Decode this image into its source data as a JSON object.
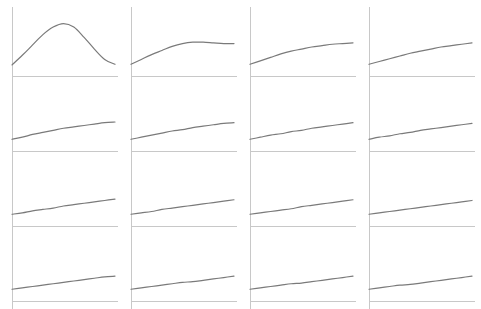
{
  "figure": {
    "rows": 4,
    "cols": 4,
    "axis_color": "#c8c8c8",
    "line_color": "#7a7a7a",
    "background": "#ffffff"
  },
  "layout": {
    "col_axis_x": [
      12,
      131,
      250,
      369
    ],
    "row_axis_y": [
      76,
      151,
      226,
      301
    ],
    "plot_width": 106,
    "plot_height": 69,
    "curve_width": 103,
    "tick_length": 8
  },
  "chart_data": [
    {
      "type": "line",
      "panel": 1,
      "title": "",
      "xlabel": "",
      "ylabel": "",
      "grid": false,
      "ylim": [
        0,
        1
      ],
      "x": [
        0,
        0.1,
        0.2,
        0.3,
        0.4,
        0.5,
        0.6,
        0.7,
        0.8,
        0.9,
        1.0
      ],
      "y": [
        0.16,
        0.3,
        0.45,
        0.6,
        0.71,
        0.76,
        0.71,
        0.56,
        0.39,
        0.24,
        0.17
      ]
    },
    {
      "type": "line",
      "panel": 2,
      "title": "",
      "xlabel": "",
      "ylabel": "",
      "grid": false,
      "ylim": [
        0,
        1
      ],
      "x": [
        0,
        0.1,
        0.2,
        0.3,
        0.4,
        0.5,
        0.6,
        0.7,
        0.8,
        0.9,
        1.0
      ],
      "y": [
        0.17,
        0.24,
        0.31,
        0.37,
        0.43,
        0.47,
        0.49,
        0.49,
        0.48,
        0.47,
        0.47
      ]
    },
    {
      "type": "line",
      "panel": 3,
      "title": "",
      "xlabel": "",
      "ylabel": "",
      "grid": false,
      "ylim": [
        0,
        1
      ],
      "x": [
        0,
        0.1,
        0.2,
        0.3,
        0.4,
        0.5,
        0.6,
        0.7,
        0.8,
        0.9,
        1.0
      ],
      "y": [
        0.17,
        0.22,
        0.27,
        0.32,
        0.36,
        0.39,
        0.42,
        0.44,
        0.46,
        0.47,
        0.48
      ]
    },
    {
      "type": "line",
      "panel": 4,
      "title": "",
      "xlabel": "",
      "ylabel": "",
      "grid": false,
      "ylim": [
        0,
        1
      ],
      "x": [
        0,
        0.1,
        0.2,
        0.3,
        0.4,
        0.5,
        0.6,
        0.7,
        0.8,
        0.9,
        1.0
      ],
      "y": [
        0.17,
        0.21,
        0.25,
        0.29,
        0.33,
        0.36,
        0.39,
        0.42,
        0.44,
        0.46,
        0.48
      ]
    },
    {
      "type": "line",
      "panel": 5,
      "title": "",
      "xlabel": "",
      "ylabel": "",
      "grid": false,
      "ylim": [
        0,
        1
      ],
      "x": [
        0,
        0.1,
        0.2,
        0.3,
        0.4,
        0.5,
        0.6,
        0.7,
        0.8,
        0.9,
        1.0
      ],
      "y": [
        0.17,
        0.2,
        0.24,
        0.27,
        0.3,
        0.33,
        0.35,
        0.37,
        0.39,
        0.41,
        0.42
      ]
    },
    {
      "type": "line",
      "panel": 6,
      "title": "",
      "xlabel": "",
      "ylabel": "",
      "grid": false,
      "ylim": [
        0,
        1
      ],
      "x": [
        0,
        0.1,
        0.2,
        0.3,
        0.4,
        0.5,
        0.6,
        0.7,
        0.8,
        0.9,
        1.0
      ],
      "y": [
        0.17,
        0.2,
        0.23,
        0.26,
        0.29,
        0.31,
        0.34,
        0.36,
        0.38,
        0.4,
        0.41
      ]
    },
    {
      "type": "line",
      "panel": 7,
      "title": "",
      "xlabel": "",
      "ylabel": "",
      "grid": false,
      "ylim": [
        0,
        1
      ],
      "x": [
        0,
        0.1,
        0.2,
        0.3,
        0.4,
        0.5,
        0.6,
        0.7,
        0.8,
        0.9,
        1.0
      ],
      "y": [
        0.17,
        0.2,
        0.23,
        0.25,
        0.28,
        0.3,
        0.33,
        0.35,
        0.37,
        0.39,
        0.41
      ]
    },
    {
      "type": "line",
      "panel": 8,
      "title": "",
      "xlabel": "",
      "ylabel": "",
      "grid": false,
      "ylim": [
        0,
        1
      ],
      "x": [
        0,
        0.1,
        0.2,
        0.3,
        0.4,
        0.5,
        0.6,
        0.7,
        0.8,
        0.9,
        1.0
      ],
      "y": [
        0.17,
        0.2,
        0.22,
        0.25,
        0.27,
        0.3,
        0.32,
        0.34,
        0.36,
        0.38,
        0.4
      ]
    },
    {
      "type": "line",
      "panel": 9,
      "title": "",
      "xlabel": "",
      "ylabel": "",
      "grid": false,
      "ylim": [
        0,
        1
      ],
      "x": [
        0,
        0.1,
        0.2,
        0.3,
        0.4,
        0.5,
        0.6,
        0.7,
        0.8,
        0.9,
        1.0
      ],
      "y": [
        0.17,
        0.19,
        0.22,
        0.24,
        0.26,
        0.29,
        0.31,
        0.33,
        0.35,
        0.37,
        0.39
      ]
    },
    {
      "type": "line",
      "panel": 10,
      "title": "",
      "xlabel": "",
      "ylabel": "",
      "grid": false,
      "ylim": [
        0,
        1
      ],
      "x": [
        0,
        0.1,
        0.2,
        0.3,
        0.4,
        0.5,
        0.6,
        0.7,
        0.8,
        0.9,
        1.0
      ],
      "y": [
        0.17,
        0.19,
        0.21,
        0.24,
        0.26,
        0.28,
        0.3,
        0.32,
        0.34,
        0.36,
        0.38
      ]
    },
    {
      "type": "line",
      "panel": 11,
      "title": "",
      "xlabel": "",
      "ylabel": "",
      "grid": false,
      "ylim": [
        0,
        1
      ],
      "x": [
        0,
        0.1,
        0.2,
        0.3,
        0.4,
        0.5,
        0.6,
        0.7,
        0.8,
        0.9,
        1.0
      ],
      "y": [
        0.17,
        0.19,
        0.21,
        0.23,
        0.25,
        0.28,
        0.3,
        0.32,
        0.34,
        0.36,
        0.38
      ]
    },
    {
      "type": "line",
      "panel": 12,
      "title": "",
      "xlabel": "",
      "ylabel": "",
      "grid": false,
      "ylim": [
        0,
        1
      ],
      "x": [
        0,
        0.1,
        0.2,
        0.3,
        0.4,
        0.5,
        0.6,
        0.7,
        0.8,
        0.9,
        1.0
      ],
      "y": [
        0.17,
        0.19,
        0.21,
        0.23,
        0.25,
        0.27,
        0.29,
        0.31,
        0.33,
        0.35,
        0.37
      ]
    },
    {
      "type": "line",
      "panel": 13,
      "title": "",
      "xlabel": "",
      "ylabel": "",
      "grid": false,
      "ylim": [
        0,
        1
      ],
      "x": [
        0,
        0.1,
        0.2,
        0.3,
        0.4,
        0.5,
        0.6,
        0.7,
        0.8,
        0.9,
        1.0
      ],
      "y": [
        0.17,
        0.19,
        0.21,
        0.23,
        0.25,
        0.27,
        0.29,
        0.31,
        0.33,
        0.35,
        0.36
      ]
    },
    {
      "type": "line",
      "panel": 14,
      "title": "",
      "xlabel": "",
      "ylabel": "",
      "grid": false,
      "ylim": [
        0,
        1
      ],
      "x": [
        0,
        0.1,
        0.2,
        0.3,
        0.4,
        0.5,
        0.6,
        0.7,
        0.8,
        0.9,
        1.0
      ],
      "y": [
        0.17,
        0.19,
        0.21,
        0.23,
        0.25,
        0.27,
        0.28,
        0.3,
        0.32,
        0.34,
        0.36
      ]
    },
    {
      "type": "line",
      "panel": 15,
      "title": "",
      "xlabel": "",
      "ylabel": "",
      "grid": false,
      "ylim": [
        0,
        1
      ],
      "x": [
        0,
        0.1,
        0.2,
        0.3,
        0.4,
        0.5,
        0.6,
        0.7,
        0.8,
        0.9,
        1.0
      ],
      "y": [
        0.17,
        0.19,
        0.21,
        0.23,
        0.25,
        0.26,
        0.28,
        0.3,
        0.32,
        0.34,
        0.36
      ]
    },
    {
      "type": "line",
      "panel": 16,
      "title": "",
      "xlabel": "",
      "ylabel": "",
      "grid": false,
      "ylim": [
        0,
        1
      ],
      "x": [
        0,
        0.1,
        0.2,
        0.3,
        0.4,
        0.5,
        0.6,
        0.7,
        0.8,
        0.9,
        1.0
      ],
      "y": [
        0.17,
        0.19,
        0.21,
        0.23,
        0.24,
        0.26,
        0.28,
        0.3,
        0.32,
        0.34,
        0.36
      ]
    }
  ]
}
